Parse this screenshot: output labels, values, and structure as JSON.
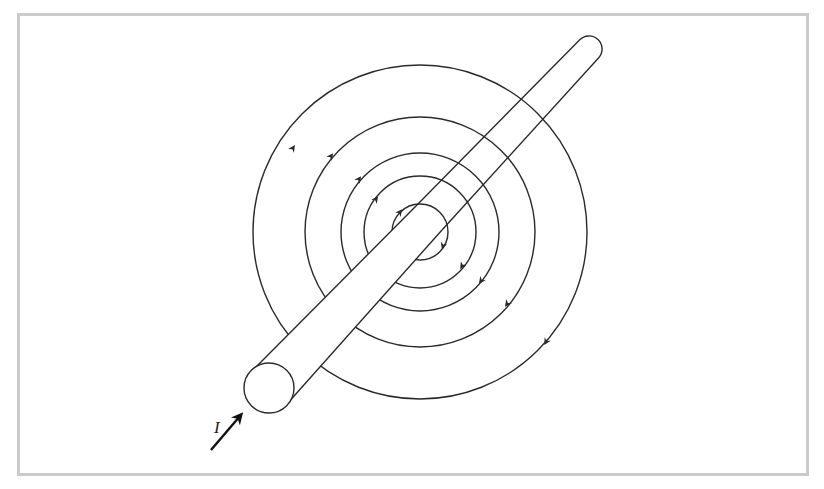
{
  "figure": {
    "current_label": "I",
    "frame_color": "#cbcbcb",
    "line_color": "#2a2a2a",
    "background": "#ffffff"
  },
  "field_lines": {
    "center": [
      420,
      232
    ],
    "radii": [
      167,
      115,
      79,
      56,
      28
    ],
    "direction": "counterclockwise-as-viewed",
    "arrows_upper_left": [
      [
        292,
        150
      ],
      [
        330,
        157
      ],
      [
        358,
        180
      ],
      [
        375,
        200
      ],
      [
        398,
        213
      ]
    ],
    "arrows_lower_right": [
      [
        547,
        340
      ],
      [
        508,
        303
      ],
      [
        482,
        280
      ],
      [
        463,
        265
      ],
      [
        444,
        245
      ]
    ]
  },
  "wire": {
    "near_end_center": [
      269,
      388
    ],
    "near_end_radius": 25,
    "far_end_center": [
      589,
      49
    ],
    "far_end_radius": 13
  },
  "current_arrow": {
    "from": [
      211,
      450
    ],
    "to": [
      243,
      412
    ]
  }
}
